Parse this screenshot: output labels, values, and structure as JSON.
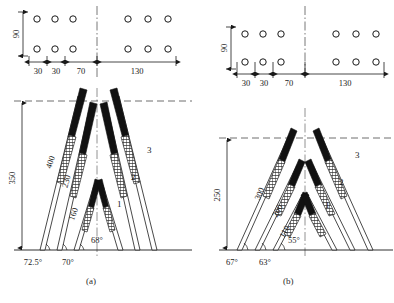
{
  "figure": {
    "type": "engineering-blasting-pattern-diagram",
    "panels": [
      {
        "id": "a",
        "caption": "(a)",
        "plan": {
          "row_spacing_label": "90",
          "horizontal_dims": [
            "30",
            "30",
            "70",
            "130"
          ],
          "hole_rows": 2,
          "holes_per_side_per_row": 3
        },
        "elevation": {
          "height_dim": "350",
          "charge_lengths": [
            "400",
            "230",
            "160"
          ],
          "angles": [
            "72.5°",
            "70°",
            "68°"
          ],
          "hole_numbers": [
            "1",
            "2",
            "3"
          ]
        }
      },
      {
        "id": "b",
        "caption": "(b)",
        "plan": {
          "row_spacing_label": "90",
          "horizontal_dims": [
            "30",
            "30",
            "70",
            "130"
          ],
          "hole_rows": 2,
          "holes_per_side_per_row": 3
        },
        "elevation": {
          "height_dim": "250",
          "charge_lengths": [
            "300",
            "200",
            "110"
          ],
          "angles": [
            "67°",
            "63°",
            "55°"
          ],
          "hole_numbers": [
            "1",
            "2",
            "3"
          ]
        }
      }
    ]
  },
  "panel_a": {
    "caption": "(a)",
    "dim_90": "90",
    "dim_30_1": "30",
    "dim_30_2": "30",
    "dim_70": "70",
    "dim_130": "130",
    "dim_height": "350",
    "len_1": "400",
    "len_2": "230",
    "len_3": "160",
    "ang_1": "72.5°",
    "ang_2": "70°",
    "ang_3": "68°",
    "num_1": "1",
    "num_2": "2",
    "num_3": "3"
  },
  "panel_b": {
    "caption": "(b)",
    "dim_90": "90",
    "dim_30_1": "30",
    "dim_30_2": "30",
    "dim_70": "70",
    "dim_130": "130",
    "dim_height": "250",
    "len_1": "300",
    "len_2": "200",
    "len_3": "110",
    "ang_1": "67°",
    "ang_2": "63°",
    "ang_3": "55°",
    "num_1": "1",
    "num_2": "2",
    "num_3": "3"
  },
  "colors": {
    "ink": "#1a1a1a",
    "charge_black": "#111111",
    "hatch": "#333333",
    "thin_line": "#3a3a3a",
    "dash": "#4a4a4a"
  }
}
